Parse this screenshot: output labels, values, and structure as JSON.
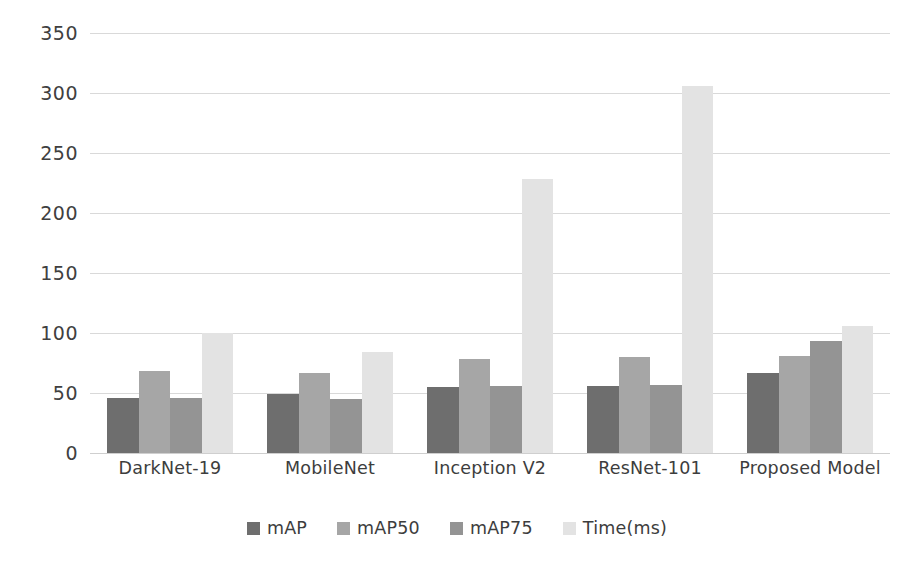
{
  "chart_data": {
    "type": "bar",
    "title": "",
    "xlabel": "",
    "ylabel": "",
    "ylim": [
      0,
      350
    ],
    "yticks": [
      0,
      50,
      100,
      150,
      200,
      250,
      300,
      350
    ],
    "ytick_labels": [
      "0",
      "50",
      "100",
      "150",
      "200",
      "250",
      "300",
      "350"
    ],
    "grid": true,
    "legend_position": "bottom",
    "categories": [
      "DarkNet-19",
      "MobileNet",
      "Inception V2",
      "ResNet-101",
      "Proposed Model"
    ],
    "series": [
      {
        "name": "mAP",
        "color": "#6e6e6e",
        "values": [
          46,
          49,
          55,
          56,
          67
        ]
      },
      {
        "name": "mAP50",
        "color": "#a6a6a6",
        "values": [
          68,
          67,
          78,
          80,
          81
        ]
      },
      {
        "name": "mAP75",
        "color": "#949494",
        "values": [
          46,
          45,
          56,
          57,
          93
        ]
      },
      {
        "name": "Time(ms)",
        "color": "#e3e3e3",
        "values": [
          100,
          84,
          228,
          306,
          106
        ]
      }
    ]
  },
  "legend": {
    "items": [
      {
        "label": "mAP"
      },
      {
        "label": "mAP50"
      },
      {
        "label": "mAP75"
      },
      {
        "label": "Time(ms)"
      }
    ]
  }
}
